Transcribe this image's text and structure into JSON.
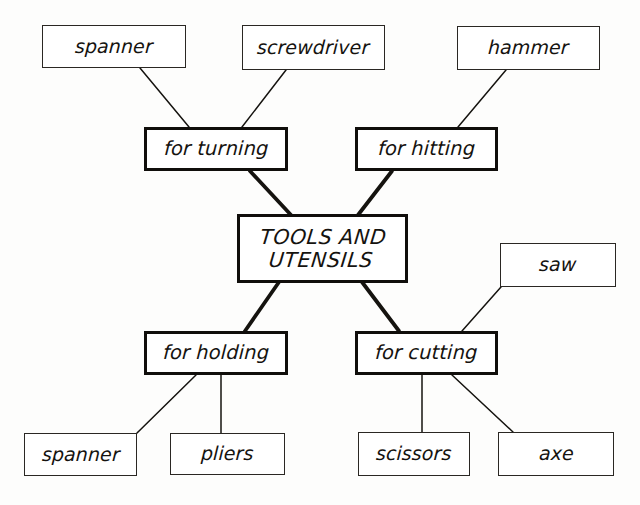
{
  "diagram": {
    "style": {
      "background": "#fdfdfc",
      "ink": "#15130f",
      "leaf_border": "#2a2723",
      "branch_border": "#100e0b"
    },
    "center": {
      "id": "center",
      "label": "TOOLS AND\nUTENSILS",
      "x": 237,
      "y": 214,
      "w": 171,
      "h": 69
    },
    "branches": [
      {
        "id": "for-turning",
        "label": "for turning",
        "x": 144,
        "y": 127,
        "w": 144,
        "h": 44
      },
      {
        "id": "for-hitting",
        "label": "for hitting",
        "x": 355,
        "y": 127,
        "w": 143,
        "h": 44
      },
      {
        "id": "for-holding",
        "label": "for holding",
        "x": 144,
        "y": 331,
        "w": 144,
        "h": 44
      },
      {
        "id": "for-cutting",
        "label": "for cutting",
        "x": 355,
        "y": 331,
        "w": 143,
        "h": 44
      }
    ],
    "leaves": [
      {
        "id": "spanner-turning",
        "label": "spanner",
        "x": 42,
        "y": 25,
        "w": 144,
        "h": 43
      },
      {
        "id": "screwdriver",
        "label": "screwdriver",
        "x": 242,
        "y": 25,
        "w": 143,
        "h": 45
      },
      {
        "id": "hammer",
        "label": "hammer",
        "x": 457,
        "y": 26,
        "w": 143,
        "h": 44
      },
      {
        "id": "saw",
        "label": "saw",
        "x": 500,
        "y": 243,
        "w": 116,
        "h": 44
      },
      {
        "id": "spanner-holding",
        "label": "spanner",
        "x": 24,
        "y": 433,
        "w": 113,
        "h": 43
      },
      {
        "id": "pliers",
        "label": "pliers",
        "x": 170,
        "y": 433,
        "w": 115,
        "h": 42
      },
      {
        "id": "scissors",
        "label": "scissors",
        "x": 358,
        "y": 432,
        "w": 112,
        "h": 44
      },
      {
        "id": "axe",
        "label": "axe",
        "x": 498,
        "y": 432,
        "w": 116,
        "h": 44
      }
    ],
    "edges": [
      {
        "id": "edge-spanner-turning",
        "from": "spanner-turning",
        "to": "for-turning",
        "x1": 140,
        "y1": 68,
        "x2": 189,
        "y2": 127,
        "weight": "thin"
      },
      {
        "id": "edge-screwdriver-turning",
        "from": "screwdriver",
        "to": "for-turning",
        "x1": 286,
        "y1": 70,
        "x2": 242,
        "y2": 127,
        "weight": "thin"
      },
      {
        "id": "edge-hammer-hitting",
        "from": "hammer",
        "to": "for-hitting",
        "x1": 506,
        "y1": 70,
        "x2": 458,
        "y2": 127,
        "weight": "thin"
      },
      {
        "id": "edge-turning-center",
        "from": "for-turning",
        "to": "center",
        "x1": 250,
        "y1": 171,
        "x2": 291,
        "y2": 215,
        "weight": "thick"
      },
      {
        "id": "edge-hitting-center",
        "from": "for-hitting",
        "to": "center",
        "x1": 392,
        "y1": 171,
        "x2": 358,
        "y2": 215,
        "weight": "thick"
      },
      {
        "id": "edge-center-holding",
        "from": "center",
        "to": "for-holding",
        "x1": 279,
        "y1": 282,
        "x2": 245,
        "y2": 331,
        "weight": "thick"
      },
      {
        "id": "edge-center-cutting",
        "from": "center",
        "to": "for-cutting",
        "x1": 362,
        "y1": 282,
        "x2": 399,
        "y2": 331,
        "weight": "thick"
      },
      {
        "id": "edge-saw-cutting",
        "from": "saw",
        "to": "for-cutting",
        "x1": 501,
        "y1": 287,
        "x2": 462,
        "y2": 331,
        "weight": "thin"
      },
      {
        "id": "edge-holding-spanner",
        "from": "for-holding",
        "to": "spanner-holding",
        "x1": 196,
        "y1": 375,
        "x2": 137,
        "y2": 433,
        "weight": "thin"
      },
      {
        "id": "edge-holding-pliers",
        "from": "for-holding",
        "to": "pliers",
        "x1": 221,
        "y1": 375,
        "x2": 221,
        "y2": 433,
        "weight": "thin"
      },
      {
        "id": "edge-cutting-scissors",
        "from": "for-cutting",
        "to": "scissors",
        "x1": 422,
        "y1": 375,
        "x2": 422,
        "y2": 432,
        "weight": "thin"
      },
      {
        "id": "edge-cutting-axe",
        "from": "for-cutting",
        "to": "axe",
        "x1": 452,
        "y1": 375,
        "x2": 513,
        "y2": 432,
        "weight": "thin"
      }
    ]
  }
}
